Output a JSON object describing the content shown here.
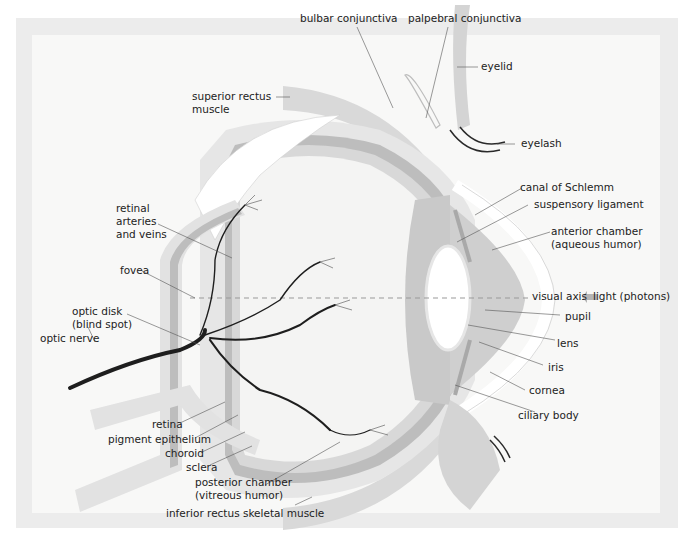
{
  "figure": {
    "colors": {
      "frame": "#ececec",
      "panel": "#f8f8f7",
      "sclera": "#e4e4e4",
      "choroid": "#bdbdbd",
      "retina": "#d6d6d6",
      "muscle": "#d9d9d9",
      "iris": "#a9a9a9",
      "ciliary": "#c9c9c9",
      "lens": "#ffffff",
      "vessels": "#1e1e1e",
      "text": "#222222"
    },
    "labels": {
      "bulbar_conjunctiva": "bulbar conjunctiva",
      "palpebral_conjunctiva": "palpebral conjunctiva",
      "eyelid": "eyelid",
      "superior_rectus_line1": "superior rectus",
      "superior_rectus_line2": "muscle",
      "eyelash": "eyelash",
      "canal_of_schlemm": "canal of Schlemm",
      "suspensory_ligament": "suspensory ligament",
      "anterior_chamber_line1": "anterior chamber",
      "anterior_chamber_line2": "(aqueous humor)",
      "retinal_vessels_line1": "retinal",
      "retinal_vessels_line2": "arteries",
      "retinal_vessels_line3": "and veins",
      "fovea": "fovea",
      "visual_axis": "visual axis",
      "light": "light (photons)",
      "optic_disk_line1": "optic disk",
      "optic_disk_line2": "(blind spot)",
      "optic_nerve": "optic nerve",
      "pupil": "pupil",
      "lens": "lens",
      "iris": "iris",
      "cornea": "cornea",
      "ciliary_body": "ciliary body",
      "retina": "retina",
      "pigment_epithelium": "pigment epithelium",
      "choroid": "choroid",
      "sclera": "sclera",
      "posterior_chamber_line1": "posterior chamber",
      "posterior_chamber_line2": "(vitreous humor)",
      "inferior_rectus": "inferior rectus skeletal muscle"
    }
  }
}
